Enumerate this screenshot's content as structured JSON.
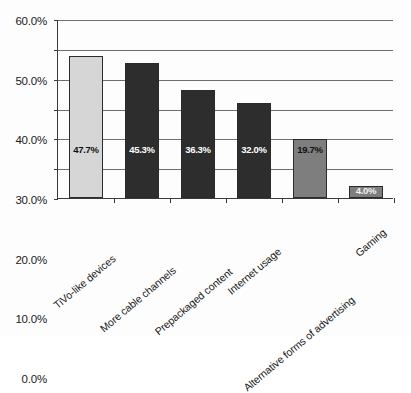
{
  "chart_data": {
    "type": "bar",
    "title": "",
    "subtitle": "",
    "xlabel": "",
    "ylabel": "",
    "ylim": [
      0,
      60
    ],
    "ytick_labels": [
      "0.0%",
      "10.0%",
      "20.0%",
      "30.0%",
      "40.0%",
      "50.0%",
      "60.0%"
    ],
    "ytick_values": [
      0,
      10,
      20,
      30,
      40,
      50,
      60
    ],
    "grid": true,
    "legend": "none",
    "categories": [
      "TiVo-like devices",
      "More cable channels",
      "Prepackaged content",
      "Internet usage",
      "Alternative forms of advertising",
      "Gaming"
    ],
    "values": [
      47.7,
      45.3,
      36.3,
      32.0,
      19.7,
      4.0
    ],
    "data_labels": [
      "47.7%",
      "45.3%",
      "36.3%",
      "32.0%",
      "19.7%",
      "4.0%"
    ],
    "bar_colors": [
      "#d6d6d6",
      "#2d2d2d",
      "#2d2d2d",
      "#2d2d2d",
      "#7e7e7e",
      "#7e7e7e"
    ],
    "bar_edge_color": "#2b2b2b",
    "label_text_colors": [
      "#111111",
      "#ffffff",
      "#ffffff",
      "#ffffff",
      "#111111",
      "#f2f2f2"
    ],
    "axis_color": "#3a3a3a",
    "gridline_color": "#6e6e6e",
    "background_color": "#fdfdfd"
  }
}
